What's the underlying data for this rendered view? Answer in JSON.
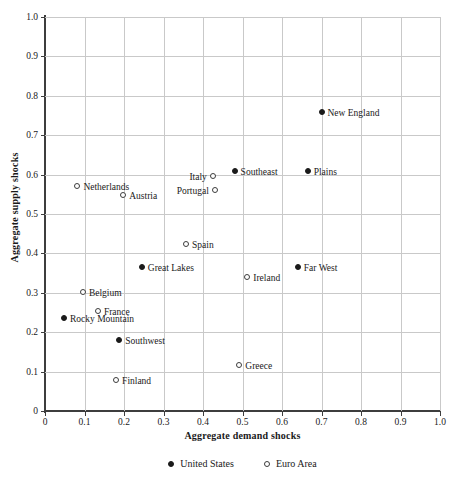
{
  "chart_data": {
    "type": "scatter",
    "title": "",
    "xlabel": "Aggregate demand shocks",
    "ylabel": "Aggregate supply shocks",
    "xlim": [
      0,
      1.0
    ],
    "ylim": [
      0,
      1.0
    ],
    "xticks": [
      "0",
      "0.1",
      "0.2",
      "0.3",
      "0.4",
      "0.5",
      "0.6",
      "0.7",
      "0.8",
      "0.9",
      "1.0"
    ],
    "yticks": [
      "0",
      "0.1",
      "0.2",
      "0.3",
      "0.4",
      "0.5",
      "0.6",
      "0.7",
      "0.8",
      "0.9",
      "1.0"
    ],
    "grid": true,
    "legend_position": "bottom",
    "series": [
      {
        "name": "United States",
        "marker": "filled-circle",
        "color": "#1a1a1a",
        "points": [
          {
            "label": "New England",
            "x": 0.7,
            "y": 0.76,
            "label_side": "right"
          },
          {
            "label": "Southeast",
            "x": 0.48,
            "y": 0.61,
            "label_side": "right"
          },
          {
            "label": "Plains",
            "x": 0.665,
            "y": 0.61,
            "label_side": "right"
          },
          {
            "label": "Great Lakes",
            "x": 0.245,
            "y": 0.365,
            "label_side": "right"
          },
          {
            "label": "Far West",
            "x": 0.64,
            "y": 0.365,
            "label_side": "right"
          },
          {
            "label": "Rocky Mountain",
            "x": 0.048,
            "y": 0.235,
            "label_side": "right"
          },
          {
            "label": "Southwest",
            "x": 0.188,
            "y": 0.18,
            "label_side": "right"
          }
        ]
      },
      {
        "name": "Euro Area",
        "marker": "open-circle",
        "color": "#3d3d3d",
        "points": [
          {
            "label": "Netherlands",
            "x": 0.082,
            "y": 0.572,
            "label_side": "right"
          },
          {
            "label": "Austria",
            "x": 0.198,
            "y": 0.547,
            "label_side": "right"
          },
          {
            "label": "Italy",
            "x": 0.425,
            "y": 0.597,
            "label_side": "left"
          },
          {
            "label": "Portugal",
            "x": 0.43,
            "y": 0.562,
            "label_side": "left"
          },
          {
            "label": "Spain",
            "x": 0.357,
            "y": 0.425,
            "label_side": "right"
          },
          {
            "label": "Ireland",
            "x": 0.512,
            "y": 0.34,
            "label_side": "right"
          },
          {
            "label": "Belgium",
            "x": 0.096,
            "y": 0.303,
            "label_side": "right"
          },
          {
            "label": "France",
            "x": 0.134,
            "y": 0.255,
            "label_side": "right"
          },
          {
            "label": "Greece",
            "x": 0.492,
            "y": 0.118,
            "label_side": "right"
          },
          {
            "label": "Finland",
            "x": 0.18,
            "y": 0.078,
            "label_side": "right"
          }
        ]
      }
    ]
  },
  "legend": {
    "items": [
      {
        "label": "United States",
        "marker": "filled-circle"
      },
      {
        "label": "Euro Area",
        "marker": "open-circle"
      }
    ]
  },
  "caption": {
    "text": ""
  }
}
